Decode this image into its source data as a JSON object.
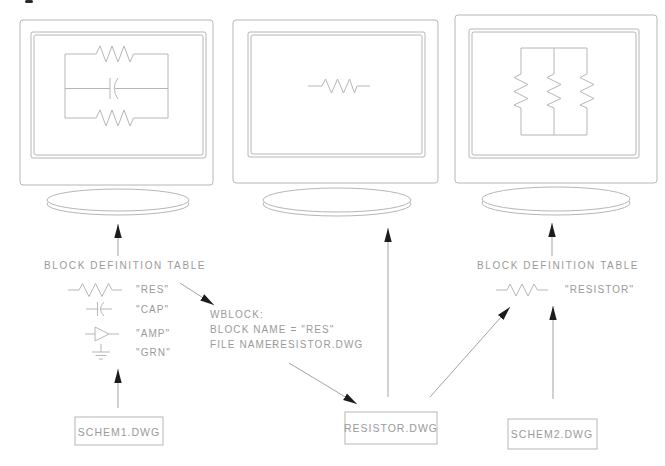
{
  "colors": {
    "line": "#b6b6b6",
    "text": "#9a9a9a",
    "arrow_line": "#a3a3a3",
    "arrowhead": "#1c1c1c",
    "background": "#ffffff"
  },
  "monitors": {
    "left_screen_content": "parallel-resistor-capacitor-circuit",
    "middle_screen_content": "single-resistor-symbol",
    "right_screen_content": "three-parallel-resistors-circuit"
  },
  "left_table": {
    "title": "BLOCK DEFINITION TABLE",
    "entries": [
      {
        "symbol": "resistor-symbol",
        "label": "\"RES\""
      },
      {
        "symbol": "capacitor-symbol",
        "label": "\"CAP\""
      },
      {
        "symbol": "amplifier-symbol",
        "label": "\"AMP\""
      },
      {
        "symbol": "ground-symbol",
        "label": "\"GRN\""
      }
    ]
  },
  "wblock_note": {
    "line1": "WBLOCK:",
    "line2": "BLOCK NAME = \"RES\"",
    "line3_label": "FILE NAME:",
    "line3_value": "RESISTOR.DWG"
  },
  "right_table": {
    "title": "BLOCK DEFINITION TABLE",
    "entries": [
      {
        "symbol": "resistor-symbol",
        "label": "\"RESISTOR\""
      }
    ]
  },
  "file_boxes": {
    "schem1": "SCHEM1.DWG",
    "resistor": "RESISTOR.DWG",
    "schem2": "SCHEM2.DWG"
  }
}
